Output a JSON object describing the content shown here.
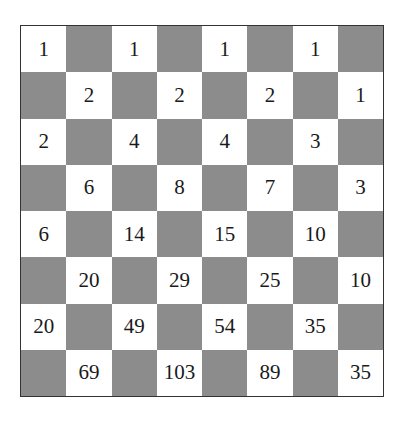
{
  "board": {
    "size": 8,
    "colors": {
      "light": "#ffffff",
      "dark": "#8c8c8c",
      "border": "#333333"
    },
    "rows": [
      [
        "1",
        "",
        "1",
        "",
        "1",
        "",
        "1",
        ""
      ],
      [
        "",
        "2",
        "",
        "2",
        "",
        "2",
        "",
        "1"
      ],
      [
        "2",
        "",
        "4",
        "",
        "4",
        "",
        "3",
        ""
      ],
      [
        "",
        "6",
        "",
        "8",
        "",
        "7",
        "",
        "3"
      ],
      [
        "6",
        "",
        "14",
        "",
        "15",
        "",
        "10",
        ""
      ],
      [
        "",
        "20",
        "",
        "29",
        "",
        "25",
        "",
        "10"
      ],
      [
        "20",
        "",
        "49",
        "",
        "54",
        "",
        "35",
        ""
      ],
      [
        "",
        "69",
        "",
        "103",
        "",
        "89",
        "",
        "35"
      ]
    ]
  }
}
